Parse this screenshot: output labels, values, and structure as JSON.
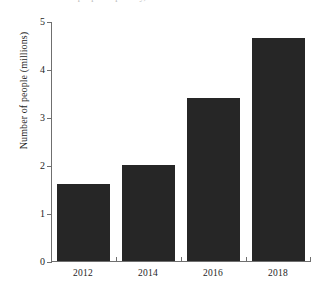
{
  "caption_sliver": "ated number of people in poverty, 2012-2018",
  "chart_data": {
    "type": "bar",
    "title": "",
    "xlabel": "",
    "ylabel": "Number of people (millions)",
    "categories": [
      "2012",
      "2014",
      "2016",
      "2018"
    ],
    "values": [
      1.6,
      2.0,
      3.4,
      4.65
    ],
    "ylim": [
      0,
      5
    ],
    "ytick_labels": [
      "0",
      "1",
      "2",
      "3",
      "4",
      "5"
    ],
    "ytick_values": [
      0,
      1,
      2,
      3,
      4,
      5
    ],
    "grid": false,
    "legend": null,
    "bar_color": "#262626",
    "axis_color": "#6f6f6f",
    "background": "#ffffff"
  }
}
